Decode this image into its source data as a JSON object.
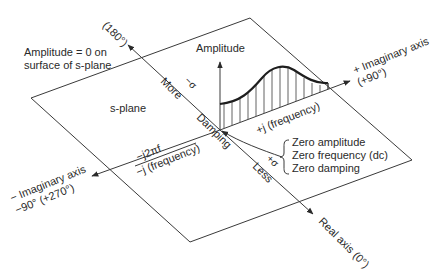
{
  "diagram": {
    "plane_label": "s-plane",
    "surface_note": [
      "Amplitude = 0 on",
      "surface of s-plane"
    ],
    "amplitude_label": "Amplitude",
    "axes": {
      "negative_real_top": "(180°)",
      "positive_real": "Real axis (0°)",
      "positive_imaginary": [
        "+ Imaginary axis",
        "(+90°)"
      ],
      "negative_imaginary": [
        "− Imaginary axis",
        "−90° (+270°)"
      ]
    },
    "real_axis_labels": {
      "more": "More",
      "minus_sigma": "−σ",
      "damping": "Damping",
      "plus_sigma": "+σ",
      "less": "Less"
    },
    "imaginary_labels": {
      "positive_frequency": "+j (frequency)",
      "neg_j2pif": "−j2πf",
      "negative_frequency": "−j (frequency)"
    },
    "origin_notes": [
      "Zero amplitude",
      "Zero frequency (dc)",
      "Zero damping"
    ],
    "colors": {
      "line": "#3a3a3a",
      "text": "#2a2a2a",
      "background": "#ffffff"
    }
  }
}
